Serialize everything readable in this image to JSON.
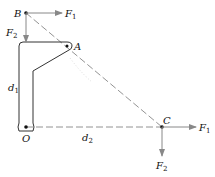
{
  "diagram": {
    "points": {
      "B": {
        "label": "B"
      },
      "A": {
        "label": "A"
      },
      "O": {
        "label": "O"
      },
      "C": {
        "label": "C"
      }
    },
    "forces": {
      "B_F1": {
        "label": "F",
        "sub": "1"
      },
      "B_F2": {
        "label": "F",
        "sub": "2"
      },
      "C_F1": {
        "label": "F",
        "sub": "1"
      },
      "C_F2": {
        "label": "F",
        "sub": "2"
      }
    },
    "distances": {
      "d1": {
        "label": "d",
        "sub": "1"
      },
      "d2": {
        "label": "d",
        "sub": "2"
      }
    },
    "colors": {
      "line": "#333333",
      "arrow": "#888888",
      "dashed": "#777777"
    }
  }
}
